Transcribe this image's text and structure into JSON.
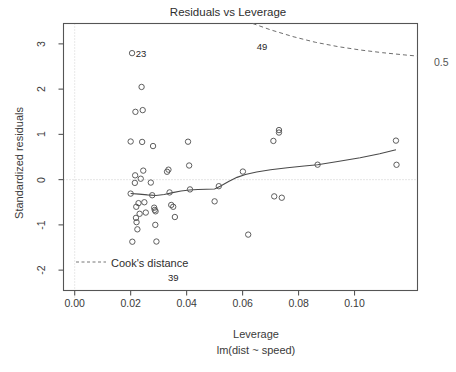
{
  "chart_data": {
    "type": "scatter",
    "title": "Residuals vs Leverage",
    "xlabel": "Leverage",
    "xsublabel": "lm(dist ~ speed)",
    "ylabel": "Standardized residuals",
    "xlim": [
      -0.004,
      0.1225
    ],
    "ylim": [
      -2.45,
      3.45
    ],
    "xticks": [
      0.0,
      0.02,
      0.04,
      0.06,
      0.08,
      0.1
    ],
    "xtick_labels": [
      "0.00",
      "0.02",
      "0.04",
      "0.06",
      "0.08",
      "0.10"
    ],
    "yticks": [
      -2,
      -1,
      0,
      1,
      2,
      3
    ],
    "ytick_labels": [
      "-2",
      "-1",
      "0",
      "1",
      "2",
      "3"
    ],
    "grid": false,
    "legend": {
      "position": "inside-bottom-left",
      "entries": [
        {
          "label": "Cook's distance",
          "style": "dashed-line",
          "color": "#777777"
        }
      ]
    },
    "zero_reference_line": {
      "y": 0,
      "style": "dotted",
      "color": "#c8c8c8"
    },
    "vertical_reference_line": {
      "x": 0.0,
      "style": "dotted",
      "color": "#c8c8c8"
    },
    "annotations": [
      {
        "text": "23",
        "x": 0.0204,
        "y": 2.795,
        "anchor": "right-of-point"
      },
      {
        "text": "49",
        "x": 0.0715,
        "y": 2.955,
        "anchor": "left-of-point"
      },
      {
        "text": "39",
        "x": 0.0355,
        "y": -2.06,
        "anchor": "below-point"
      },
      {
        "text": "0.5",
        "x": 0.1225,
        "y": 2.73,
        "anchor": "outside-right"
      }
    ],
    "series": [
      {
        "name": "observations",
        "marker": "open-circle",
        "color": "#555555",
        "points": [
          [
            0.02,
            -0.309
          ],
          [
            0.02,
            0.842
          ],
          [
            0.0205,
            2.795
          ],
          [
            0.0206,
            -1.372
          ],
          [
            0.0215,
            -0.072
          ],
          [
            0.0216,
            0.095
          ],
          [
            0.0217,
            1.498
          ],
          [
            0.0219,
            -0.845
          ],
          [
            0.022,
            -0.6
          ],
          [
            0.0221,
            -0.94
          ],
          [
            0.0224,
            -1.098
          ],
          [
            0.0228,
            -0.52
          ],
          [
            0.0232,
            -0.755
          ],
          [
            0.0236,
            0.02
          ],
          [
            0.0239,
            2.048
          ],
          [
            0.0241,
            0.833
          ],
          [
            0.0243,
            1.536
          ],
          [
            0.0245,
            0.199
          ],
          [
            0.0249,
            -0.5
          ],
          [
            0.0254,
            -0.728
          ],
          [
            0.0272,
            -0.065
          ],
          [
            0.0277,
            -0.345
          ],
          [
            0.028,
            0.742
          ],
          [
            0.0284,
            -0.62
          ],
          [
            0.0286,
            -0.67
          ],
          [
            0.0288,
            -1.0
          ],
          [
            0.0289,
            -0.7
          ],
          [
            0.0292,
            -1.368
          ],
          [
            0.033,
            0.174
          ],
          [
            0.0335,
            0.22
          ],
          [
            0.0339,
            -0.283
          ],
          [
            0.0345,
            -0.56
          ],
          [
            0.0352,
            -0.6
          ],
          [
            0.0358,
            -0.826
          ],
          [
            0.0405,
            0.838
          ],
          [
            0.0409,
            0.312
          ],
          [
            0.0412,
            -0.216
          ],
          [
            0.05,
            -0.48
          ],
          [
            0.0515,
            -0.145
          ],
          [
            0.0601,
            0.178
          ],
          [
            0.062,
            -1.215
          ],
          [
            0.071,
            0.855
          ],
          [
            0.0713,
            -0.37
          ],
          [
            0.073,
            1.095
          ],
          [
            0.073,
            1.04
          ],
          [
            0.074,
            -0.4
          ],
          [
            0.0868,
            0.33
          ],
          [
            0.1148,
            0.862
          ],
          [
            0.115,
            0.328
          ]
        ]
      }
    ],
    "smoother": {
      "name": "loess-smoother",
      "color": "#4a4a4a",
      "points": [
        [
          0.02,
          -0.305
        ],
        [
          0.023,
          -0.32
        ],
        [
          0.026,
          -0.338
        ],
        [
          0.029,
          -0.35
        ],
        [
          0.032,
          -0.33
        ],
        [
          0.035,
          -0.288
        ],
        [
          0.038,
          -0.252
        ],
        [
          0.041,
          -0.228
        ],
        [
          0.044,
          -0.218
        ],
        [
          0.047,
          -0.214
        ],
        [
          0.05,
          -0.208
        ],
        [
          0.052,
          -0.148
        ],
        [
          0.055,
          -0.042
        ],
        [
          0.058,
          0.05
        ],
        [
          0.061,
          0.112
        ],
        [
          0.065,
          0.168
        ],
        [
          0.07,
          0.218
        ],
        [
          0.076,
          0.262
        ],
        [
          0.082,
          0.3
        ],
        [
          0.0868,
          0.33
        ],
        [
          0.094,
          0.4
        ],
        [
          0.102,
          0.485
        ],
        [
          0.109,
          0.57
        ],
        [
          0.1148,
          0.662
        ]
      ]
    },
    "cooks_contour": {
      "name": "cooks-distance-0.5",
      "level": 0.5,
      "color": "#6e6e6e",
      "style": "dashed",
      "points": [
        [
          0.0636,
          3.45
        ],
        [
          0.07,
          3.31
        ],
        [
          0.078,
          3.16
        ],
        [
          0.086,
          3.035
        ],
        [
          0.094,
          2.94
        ],
        [
          0.102,
          2.865
        ],
        [
          0.11,
          2.805
        ],
        [
          0.118,
          2.755
        ],
        [
          0.1225,
          2.73
        ]
      ]
    }
  },
  "labels": {
    "title": "Residuals vs Leverage",
    "xlabel": "Leverage",
    "xsublabel": "lm(dist ~ speed)",
    "ylabel": "Standardized residuals",
    "cooks_legend": "Cook's distance",
    "contour_05": "0.5",
    "point_23": "23",
    "point_49": "49",
    "point_39": "39"
  }
}
